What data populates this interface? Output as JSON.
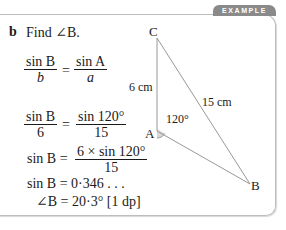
{
  "badge": "EXAMPLE",
  "part": {
    "letter": "b",
    "prompt": "Find ∠B."
  },
  "working": {
    "line1": {
      "lhs_num": "sin B",
      "lhs_den": "b",
      "eq": "=",
      "rhs_num": "sin A",
      "rhs_den": "a"
    },
    "line2": {
      "lhs_num": "sin B",
      "lhs_den": "6",
      "eq": "=",
      "rhs_num": "sin 120°",
      "rhs_den": "15"
    },
    "line3": {
      "lhs": "sin B =",
      "rhs_num": "6 × sin 120°",
      "rhs_den": "15"
    },
    "line4": "sin B = 0·346 . . .",
    "line5": "∠B = 20·3° [1 dp]"
  },
  "diagram": {
    "vertices": {
      "A": "A",
      "B": "B",
      "C": "C"
    },
    "side_AC": "6 cm",
    "side_CB": "15 cm",
    "angle_A": "120°"
  }
}
